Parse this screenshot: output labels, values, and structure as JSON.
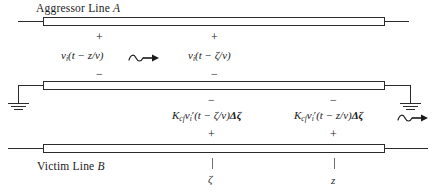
{
  "figure": {
    "title_top": "Aggressor Line A",
    "title_bottom": "Victim Line B",
    "background_color": "#ffffff",
    "line_color": "#2b2b2b"
  },
  "aggressor": {
    "label": "Aggressor Line",
    "label_italic": "A",
    "plus_left": "+",
    "plus_right": "+",
    "minus_left": "−",
    "minus_right": "−",
    "voltage_left": "v",
    "voltage_left_sub": "i",
    "voltage_left_arg": "(t − z/v)",
    "voltage_right": "v",
    "voltage_right_sub": "i",
    "voltage_right_arg": "(t − ζ/v)"
  },
  "victim": {
    "label": "Victim Line",
    "label_italic": "B",
    "minus_left": "−",
    "minus_right": "−",
    "plus_left": "+",
    "plus_right": "+",
    "source_left_k": "K",
    "source_left_k_sub": "cf",
    "source_left_v": "v",
    "source_left_v_sub": "i",
    "source_left_prime": "′",
    "source_left_arg": "(t − ζ/v)",
    "source_left_delta": "Δζ",
    "source_right_k": "K",
    "source_right_k_sub": "cf",
    "source_right_v": "v",
    "source_right_v_sub": "i",
    "source_right_prime": "′",
    "source_right_arg": "(t − z/v)",
    "source_right_delta": "Δζ"
  },
  "coordinates": {
    "zeta": "ζ",
    "z": "z"
  },
  "icons": {
    "wave_arrow_left": "wave-arrow-icon",
    "wave_arrow_right": "wave-arrow-icon",
    "ground_left": "ground-icon",
    "ground_right": "ground-icon"
  }
}
